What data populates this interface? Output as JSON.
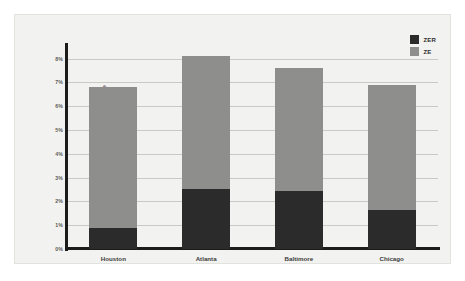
{
  "chart_data": {
    "type": "bar",
    "stacked": true,
    "title": "",
    "xlabel": "",
    "ylabel": "Incremental Cost Compared to Code Baseline",
    "categories": [
      "Houston",
      "Atlanta",
      "Baltimore",
      "Chicago"
    ],
    "series": [
      {
        "name": "ZER",
        "color": "#2b2b2b",
        "values": [
          0.9,
          2.5,
          2.45,
          1.65
        ]
      },
      {
        "name": "ZE",
        "color": "#8e8e8c",
        "values": [
          5.9,
          5.6,
          5.15,
          5.25
        ]
      }
    ],
    "totals": [
      6.8,
      8.1,
      7.6,
      6.9
    ],
    "ylim": [
      0,
      8.4
    ],
    "yticks": [
      0,
      1,
      2,
      3,
      4,
      5,
      6,
      7,
      8
    ],
    "ytick_labels": [
      "0%",
      "1%",
      "2%",
      "3%",
      "4%",
      "5%",
      "6%",
      "7%",
      "8%"
    ],
    "grid": true,
    "legend_position": "top-right",
    "legend": [
      {
        "label": "ZER",
        "color": "#2b2b2b"
      },
      {
        "label": "ZE",
        "color": "#8e8e8c"
      }
    ],
    "colors": {
      "plot_background": "#f2f2f0",
      "gridline": "#c9c9c6",
      "axis": "#1c1c1c",
      "text": "#3b3b3a",
      "zer": "#2b2b2b",
      "ze": "#8e8e8c"
    }
  }
}
